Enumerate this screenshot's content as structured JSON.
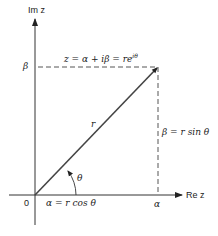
{
  "diagram": {
    "axes": {
      "imag_label": "Im z",
      "real_label": "Re z",
      "origin_label": "0"
    },
    "equation": "z = α + iβ = re^{iθ}",
    "equation_main": "z = α + iβ = re",
    "equation_sup": "iθ",
    "labels": {
      "beta_axis": "β",
      "alpha_axis": "α",
      "radius": "r",
      "angle": "θ",
      "beta_eq": "β = r sin θ",
      "alpha_eq": "α = r cos θ"
    },
    "colors": {
      "line": "#333333",
      "dash": "#555555",
      "bg": "#ffffff"
    }
  }
}
